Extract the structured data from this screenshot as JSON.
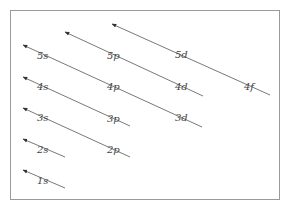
{
  "diagram": {
    "frame_color": "#9a9a9a",
    "line_color": "#555555",
    "arrows": [
      {
        "id": "1s",
        "x1": 65,
        "y1": 188,
        "x2": 23,
        "y2": 170,
        "labels": [
          {
            "text": "1s",
            "x": 37,
            "y": 184
          }
        ]
      },
      {
        "id": "2s",
        "x1": 65,
        "y1": 157,
        "x2": 23,
        "y2": 139,
        "labels": [
          {
            "text": "2s",
            "x": 37,
            "y": 153
          }
        ]
      },
      {
        "id": "3s-2p",
        "x1": 130,
        "y1": 157,
        "x2": 23,
        "y2": 108,
        "labels": [
          {
            "text": "3s",
            "x": 37,
            "y": 121
          },
          {
            "text": "2p",
            "x": 107,
            "y": 153
          }
        ]
      },
      {
        "id": "4s-3p",
        "x1": 130,
        "y1": 126,
        "x2": 23,
        "y2": 77,
        "labels": [
          {
            "text": "4s",
            "x": 37,
            "y": 90
          },
          {
            "text": "3p",
            "x": 107,
            "y": 122
          }
        ]
      },
      {
        "id": "5s-4p-3d",
        "x1": 202,
        "y1": 127,
        "x2": 23,
        "y2": 45,
        "labels": [
          {
            "text": "5s",
            "x": 37,
            "y": 59
          },
          {
            "text": "4p",
            "x": 107,
            "y": 90
          },
          {
            "text": "3d",
            "x": 175,
            "y": 121
          }
        ]
      },
      {
        "id": "5p-4d",
        "x1": 203,
        "y1": 96,
        "x2": 65,
        "y2": 32,
        "labels": [
          {
            "text": "5p",
            "x": 107,
            "y": 59
          },
          {
            "text": "4d",
            "x": 175,
            "y": 90
          }
        ]
      },
      {
        "id": "5d-4f",
        "x1": 270,
        "y1": 95,
        "x2": 112,
        "y2": 24,
        "labels": [
          {
            "text": "5d",
            "x": 175,
            "y": 58
          },
          {
            "text": "4f",
            "x": 244,
            "y": 90
          }
        ]
      }
    ]
  }
}
